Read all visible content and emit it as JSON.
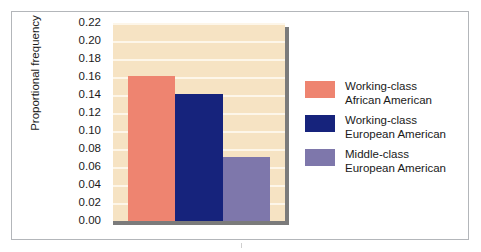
{
  "chart_data": {
    "type": "bar",
    "title": "",
    "xlabel": "",
    "ylabel": "Proportional frequency",
    "ylim": [
      0.0,
      0.22
    ],
    "ytick_step": 0.02,
    "grid": true,
    "legend_position": "right",
    "categories": [
      "Working-class African American",
      "Working-class European American",
      "Middle-class European American"
    ],
    "values": [
      0.161,
      0.141,
      0.071
    ],
    "ytick_labels": [
      "0.22",
      "0.20",
      "0.18",
      "0.16",
      "0.14",
      "0.12",
      "0.10",
      "0.08",
      "0.06",
      "0.04",
      "0.02",
      "0.00"
    ],
    "ytick_values": [
      0.22,
      0.2,
      0.18,
      0.16,
      0.14,
      0.12,
      0.1,
      0.08,
      0.06,
      0.04,
      0.02,
      0.0
    ],
    "legend": [
      {
        "line1": "Working-class",
        "line2": "African American",
        "color": "#ee8470"
      },
      {
        "line1": "Working-class",
        "line2": "European American",
        "color": "#16237c"
      },
      {
        "line1": "Middle-class",
        "line2": "European American",
        "color": "#7e77ab"
      }
    ],
    "colors": {
      "plot_background": "#f6e3c3",
      "gridline": "#fdf6e9",
      "axis": "#7b7b7b",
      "frame": "#b3b6ba",
      "text": "#1a1a1a"
    }
  }
}
